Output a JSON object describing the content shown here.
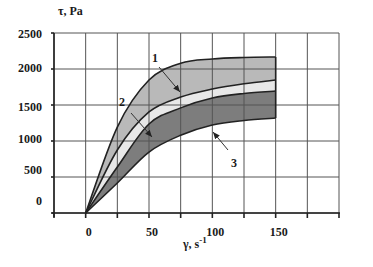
{
  "chart_data": {
    "type": "area",
    "title": "",
    "xlabel": "γ, s",
    "xlabel_sup": "-1",
    "ylabel": "τ, Pa",
    "xlim": [
      -25,
      200
    ],
    "ylim": [
      0,
      2500
    ],
    "x_ticks": [
      0,
      50,
      100,
      150
    ],
    "x_tick_labels": [
      "0",
      "50",
      "100",
      "150"
    ],
    "y_ticks": [
      0,
      500,
      1000,
      1500,
      2000,
      2500
    ],
    "y_tick_labels": [
      "0",
      "500",
      "1000",
      "1500",
      "2000",
      "2500"
    ],
    "grid": true,
    "x": [
      0,
      25,
      50,
      75,
      100,
      125,
      150
    ],
    "series": [
      {
        "name": "curve-1-upper",
        "values": [
          0,
          1194,
          1847,
          2080,
          2139,
          2160,
          2167
        ]
      },
      {
        "name": "curve-boundary-1-2",
        "values": [
          0,
          875,
          1403,
          1610,
          1722,
          1795,
          1847
        ]
      },
      {
        "name": "curve-3-upper",
        "values": [
          0,
          639,
          1236,
          1460,
          1597,
          1660,
          1694
        ]
      },
      {
        "name": "curve-3-lower",
        "values": [
          0,
          417,
          847,
          1080,
          1222,
          1285,
          1319
        ]
      }
    ],
    "bands": [
      {
        "name": "1",
        "between": [
          "curve-1-upper",
          "curve-boundary-1-2"
        ],
        "color": "#b9b9b9"
      },
      {
        "name": "2",
        "between": [
          "curve-boundary-1-2",
          "curve-3-upper"
        ],
        "color": "#e8e8e8"
      },
      {
        "name": "3",
        "between": [
          "curve-3-upper",
          "curve-3-lower"
        ],
        "color": "#7d7d7d"
      }
    ],
    "annotations": [
      {
        "label": "1",
        "text_x": 155,
        "text_y": 62,
        "arrow": [
          159,
          67,
          180,
          92
        ]
      },
      {
        "label": "2",
        "text_x": 122,
        "text_y": 106,
        "arrow": [
          131,
          113,
          152,
          137
        ]
      },
      {
        "label": "3",
        "text_x": 234,
        "text_y": 167,
        "arrow": [
          228,
          150,
          213,
          132
        ]
      }
    ]
  }
}
